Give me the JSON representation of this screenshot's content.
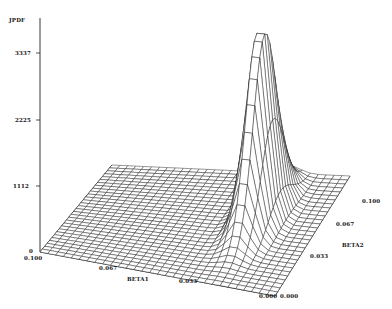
{
  "chart_data": {
    "type": "surface3d",
    "title": "",
    "zlabel": "JPDF",
    "xlabel": "BETA1",
    "ylabel": "BETA2",
    "z_ticks": [
      "0",
      "1112",
      "2225",
      "3337"
    ],
    "z_range": [
      0,
      3337
    ],
    "x_ticks": [
      "0.100",
      "0.067",
      "0.033",
      "0.000"
    ],
    "x_range": [
      0.0,
      0.1
    ],
    "y_ticks": [
      "0.000",
      "0.033",
      "0.067",
      "0.100"
    ],
    "y_range": [
      0.0,
      0.1
    ],
    "grid": false,
    "legend": "none",
    "style": "wireframe mesh, monochrome",
    "surface_description": "Joint PDF is near zero over most of the (BETA1, BETA2) domain and rises into a sharp ridge/peak of about 3337 near BETA1 ≈ 0.02–0.03, BETA2 ≈ 0.05–0.07, dropping steeply toward the BETA1 = 0 edge.",
    "peak": {
      "BETA1": 0.025,
      "BETA2": 0.06,
      "JPDF": 3337
    }
  },
  "labels": {
    "z_axis": "JPDF",
    "z_tick_3337": "3337",
    "z_tick_2225": "2225",
    "z_tick_1112": "1112",
    "z_tick_0": "0",
    "x_axis": "BETA1",
    "x_tick_0100": "0.100",
    "x_tick_0067": "0.067",
    "x_tick_0033": "0.033",
    "x_tick_0000": "0.000",
    "y_axis": "BETA2",
    "y_tick_0000": "0.000",
    "y_tick_0033": "0.033",
    "y_tick_0067": "0.067",
    "y_tick_0100": "0.100"
  }
}
